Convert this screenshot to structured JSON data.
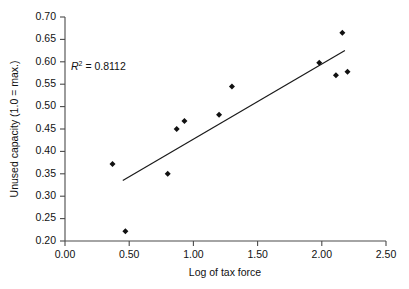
{
  "chart_data": {
    "type": "scatter",
    "title": "",
    "xlabel": "Log of tax force",
    "ylabel": "Unused capacity (1.0 = max.)",
    "xlim": [
      0.0,
      2.5
    ],
    "ylim": [
      0.2,
      0.7
    ],
    "xticks": [
      0.0,
      0.5,
      1.0,
      1.5,
      2.0,
      2.5
    ],
    "xticklabels": [
      "0.00",
      "0.50",
      "1.00",
      "1.50",
      "2.00",
      "2.50"
    ],
    "yticks": [
      0.2,
      0.25,
      0.3,
      0.35,
      0.4,
      0.45,
      0.5,
      0.55,
      0.6,
      0.65,
      0.7
    ],
    "yticklabels": [
      "0.20",
      "0.25",
      "0.30",
      "0.35",
      "0.40",
      "0.45",
      "0.50",
      "0.55",
      "0.60",
      "0.65",
      "0.70"
    ],
    "grid": false,
    "legend": null,
    "marker": "diamond",
    "marker_color": "#111111",
    "points": [
      {
        "x": 0.37,
        "y": 0.372
      },
      {
        "x": 0.47,
        "y": 0.222
      },
      {
        "x": 0.8,
        "y": 0.35
      },
      {
        "x": 0.87,
        "y": 0.45
      },
      {
        "x": 0.93,
        "y": 0.468
      },
      {
        "x": 1.2,
        "y": 0.482
      },
      {
        "x": 1.3,
        "y": 0.545
      },
      {
        "x": 1.98,
        "y": 0.598
      },
      {
        "x": 2.16,
        "y": 0.665
      },
      {
        "x": 2.11,
        "y": 0.57
      },
      {
        "x": 2.2,
        "y": 0.578
      }
    ],
    "trendline": {
      "x_start": 0.45,
      "y_start": 0.335,
      "x_end": 2.18,
      "y_end": 0.625,
      "color": "#1a1a1a"
    },
    "annotations": [
      {
        "name": "r-squared-label",
        "text_prefix": "R",
        "text_superscript": "2",
        "text_suffix": " = 0.8112",
        "full_text": "R2 = 0.8112",
        "x": 0.1,
        "y": 0.598
      }
    ]
  }
}
